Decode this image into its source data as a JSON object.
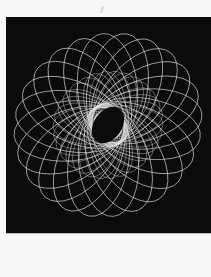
{
  "image": {
    "description": "Spirograph torus-knot pattern of rotated white ellipses on black background",
    "colors": {
      "page_background": "#f7f7f7",
      "frame_background": "#0b0b0b",
      "line_color": "#e6e6e6"
    },
    "pattern": {
      "center": [
        102,
        108
      ],
      "outer_ring": {
        "count": 24,
        "rx": 56,
        "ry": 30,
        "offset": 40
      },
      "inner_ring": {
        "count": 30,
        "rx": 34,
        "ry": 18,
        "offset": 22
      }
    }
  }
}
